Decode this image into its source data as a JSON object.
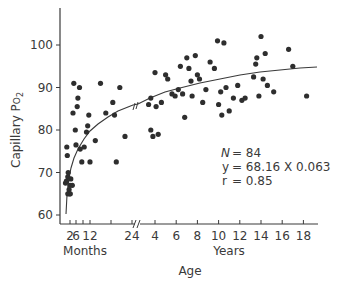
{
  "chart_data": {
    "type": "scatter",
    "title": "",
    "xlabel": "Age",
    "ylabel": "Capillary PO2",
    "ylabel_main": "Capillary P",
    "ylabel_sub_O": "O",
    "ylabel_sub_2": "2",
    "ylim": [
      60,
      100
    ],
    "yticks": [
      60,
      70,
      80,
      90,
      100
    ],
    "x_segments": [
      {
        "name": "Months",
        "ticks": [
          2,
          6,
          12,
          24
        ],
        "tick_labels": [
          "2",
          "6",
          "12",
          "24"
        ]
      },
      {
        "name": "Years",
        "ticks": [
          4,
          6,
          8,
          10,
          12,
          14,
          16,
          18
        ],
        "tick_labels": [
          "4",
          "6",
          "8",
          "10",
          "12",
          "14",
          "16",
          "18"
        ]
      }
    ],
    "axis_break_after": "24 months",
    "grid": false,
    "annotation": {
      "n_label": "N",
      "n_value": "= 84",
      "y_label": "y",
      "y_value": "= 68.16 X 0.063",
      "r_label": "r",
      "r_value": "= 0.85"
    },
    "fit_curve": {
      "type": "power",
      "equation": "y = 68.16 X^0.063",
      "r": 0.85
    },
    "series": [
      {
        "name": "Observations",
        "unit_note": "months points use segment 'm', years points use segment 'y'",
        "points": [
          {
            "seg": "m",
            "x": 1.0,
            "y": 67.5
          },
          {
            "seg": "m",
            "x": 1.2,
            "y": 68.0
          },
          {
            "seg": "m",
            "x": 1.5,
            "y": 69.0
          },
          {
            "seg": "m",
            "x": 1.6,
            "y": 70.0
          },
          {
            "seg": "m",
            "x": 1.8,
            "y": 66.0
          },
          {
            "seg": "m",
            "x": 1.9,
            "y": 65.0
          },
          {
            "seg": "m",
            "x": 1.5,
            "y": 65.0
          },
          {
            "seg": "m",
            "x": 2.2,
            "y": 65.0
          },
          {
            "seg": "m",
            "x": 2.0,
            "y": 67.0
          },
          {
            "seg": "m",
            "x": 1.3,
            "y": 76.0
          },
          {
            "seg": "m",
            "x": 1.4,
            "y": 74.0
          },
          {
            "seg": "m",
            "x": 2.5,
            "y": 68.5
          },
          {
            "seg": "m",
            "x": 3.5,
            "y": 67.0
          },
          {
            "seg": "m",
            "x": 4.0,
            "y": 84.0
          },
          {
            "seg": "m",
            "x": 4.5,
            "y": 91.0
          },
          {
            "seg": "m",
            "x": 5.5,
            "y": 80.0
          },
          {
            "seg": "m",
            "x": 6.0,
            "y": 76.5
          },
          {
            "seg": "m",
            "x": 6.5,
            "y": 85.5
          },
          {
            "seg": "m",
            "x": 6.8,
            "y": 87.5
          },
          {
            "seg": "m",
            "x": 7.5,
            "y": 90.0
          },
          {
            "seg": "m",
            "x": 7.8,
            "y": 75.5
          },
          {
            "seg": "m",
            "x": 8.5,
            "y": 72.5
          },
          {
            "seg": "m",
            "x": 9.5,
            "y": 76.0
          },
          {
            "seg": "m",
            "x": 10.5,
            "y": 79.5
          },
          {
            "seg": "m",
            "x": 11.0,
            "y": 81.0
          },
          {
            "seg": "m",
            "x": 11.5,
            "y": 83.5
          },
          {
            "seg": "m",
            "x": 12.0,
            "y": 72.5
          },
          {
            "seg": "m",
            "x": 13.5,
            "y": 77.5
          },
          {
            "seg": "m",
            "x": 15.0,
            "y": 91.0
          },
          {
            "seg": "m",
            "x": 16.5,
            "y": 84.0
          },
          {
            "seg": "m",
            "x": 18.5,
            "y": 86.5
          },
          {
            "seg": "m",
            "x": 19.0,
            "y": 83.5
          },
          {
            "seg": "m",
            "x": 19.5,
            "y": 72.5
          },
          {
            "seg": "m",
            "x": 20.5,
            "y": 90.0
          },
          {
            "seg": "m",
            "x": 22.0,
            "y": 78.5
          },
          {
            "seg": "y",
            "x": 3.4,
            "y": 86.0
          },
          {
            "seg": "y",
            "x": 3.6,
            "y": 87.5
          },
          {
            "seg": "y",
            "x": 3.6,
            "y": 80.0
          },
          {
            "seg": "y",
            "x": 3.8,
            "y": 78.5
          },
          {
            "seg": "y",
            "x": 4.0,
            "y": 93.5
          },
          {
            "seg": "y",
            "x": 4.1,
            "y": 85.5
          },
          {
            "seg": "y",
            "x": 4.3,
            "y": 79.0
          },
          {
            "seg": "y",
            "x": 4.6,
            "y": 86.5
          },
          {
            "seg": "y",
            "x": 5.0,
            "y": 93.0
          },
          {
            "seg": "y",
            "x": 5.2,
            "y": 92.0
          },
          {
            "seg": "y",
            "x": 5.6,
            "y": 88.5
          },
          {
            "seg": "y",
            "x": 5.9,
            "y": 88.0
          },
          {
            "seg": "y",
            "x": 6.2,
            "y": 89.5
          },
          {
            "seg": "y",
            "x": 6.4,
            "y": 95.0
          },
          {
            "seg": "y",
            "x": 6.6,
            "y": 88.5
          },
          {
            "seg": "y",
            "x": 6.8,
            "y": 83.0
          },
          {
            "seg": "y",
            "x": 7.0,
            "y": 97.0
          },
          {
            "seg": "y",
            "x": 7.2,
            "y": 94.5
          },
          {
            "seg": "y",
            "x": 7.4,
            "y": 91.5
          },
          {
            "seg": "y",
            "x": 7.5,
            "y": 88.0
          },
          {
            "seg": "y",
            "x": 7.8,
            "y": 97.5
          },
          {
            "seg": "y",
            "x": 8.0,
            "y": 93.0
          },
          {
            "seg": "y",
            "x": 8.2,
            "y": 92.0
          },
          {
            "seg": "y",
            "x": 8.5,
            "y": 86.5
          },
          {
            "seg": "y",
            "x": 8.8,
            "y": 89.5
          },
          {
            "seg": "y",
            "x": 9.2,
            "y": 96.0
          },
          {
            "seg": "y",
            "x": 9.6,
            "y": 94.5
          },
          {
            "seg": "y",
            "x": 9.9,
            "y": 101.0
          },
          {
            "seg": "y",
            "x": 10.0,
            "y": 86.0
          },
          {
            "seg": "y",
            "x": 10.2,
            "y": 89.0
          },
          {
            "seg": "y",
            "x": 10.3,
            "y": 83.5
          },
          {
            "seg": "y",
            "x": 10.5,
            "y": 100.5
          },
          {
            "seg": "y",
            "x": 10.7,
            "y": 90.0
          },
          {
            "seg": "y",
            "x": 11.0,
            "y": 84.5
          },
          {
            "seg": "y",
            "x": 11.4,
            "y": 87.5
          },
          {
            "seg": "y",
            "x": 11.8,
            "y": 90.5
          },
          {
            "seg": "y",
            "x": 12.2,
            "y": 87.0
          },
          {
            "seg": "y",
            "x": 12.5,
            "y": 87.5
          },
          {
            "seg": "y",
            "x": 13.3,
            "y": 92.5
          },
          {
            "seg": "y",
            "x": 13.5,
            "y": 95.5
          },
          {
            "seg": "y",
            "x": 13.6,
            "y": 97.0
          },
          {
            "seg": "y",
            "x": 13.8,
            "y": 88.0
          },
          {
            "seg": "y",
            "x": 14.0,
            "y": 102.0
          },
          {
            "seg": "y",
            "x": 14.2,
            "y": 92.0
          },
          {
            "seg": "y",
            "x": 14.4,
            "y": 98.0
          },
          {
            "seg": "y",
            "x": 14.6,
            "y": 90.5
          },
          {
            "seg": "y",
            "x": 15.2,
            "y": 89.0
          },
          {
            "seg": "y",
            "x": 16.6,
            "y": 99.0
          },
          {
            "seg": "y",
            "x": 17.0,
            "y": 95.0
          },
          {
            "seg": "y",
            "x": 18.3,
            "y": 88.0
          }
        ]
      }
    ]
  }
}
